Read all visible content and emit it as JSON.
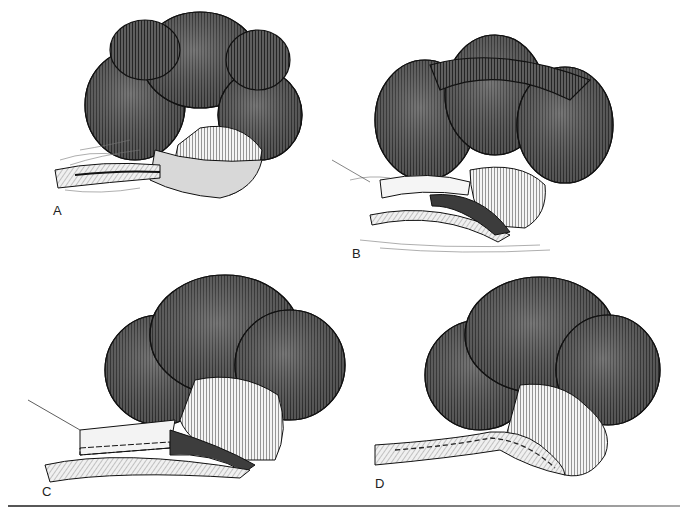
{
  "figure": {
    "panels": [
      {
        "label": "A",
        "subject": "lobulated organ with wrapped tubular structure at base"
      },
      {
        "label": "B",
        "subject": "tubular structure opened longitudinally with flaps reflected"
      },
      {
        "label": "C",
        "subject": "flap sutured along incision, suture line visible"
      },
      {
        "label": "D",
        "subject": "completed repair with continuous suture line along tube"
      }
    ],
    "colors": {
      "organ_fill": "#5a5a5a",
      "organ_highlight": "#8a8a8a",
      "hatch": "#222222",
      "pale_tissue": "#f2f2f2",
      "background": "#ffffff",
      "divider": "#666666"
    }
  }
}
